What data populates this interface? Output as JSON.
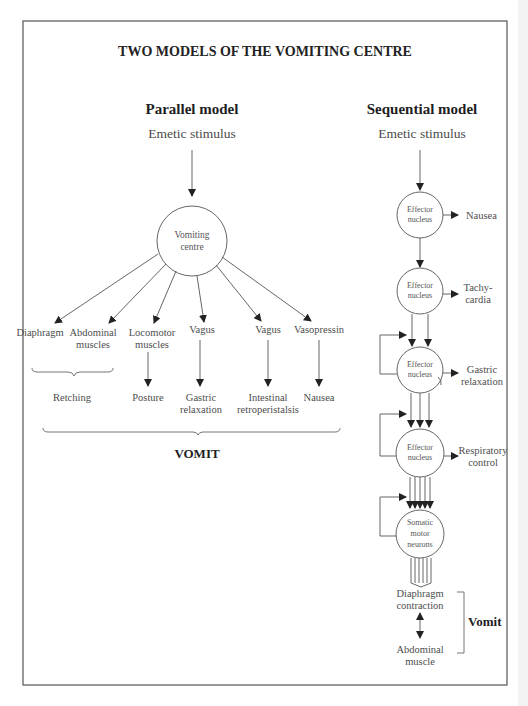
{
  "title": "TWO MODELS OF THE VOMITING CENTRE",
  "parallel": {
    "heading": "Parallel model",
    "stimulus": "Emetic stimulus",
    "centre": [
      "Vomiting",
      "centre"
    ],
    "outputs": [
      {
        "name": [
          "Diaphragm"
        ],
        "effect": null
      },
      {
        "name": [
          "Abdominal",
          "muscles"
        ],
        "effect": null
      },
      {
        "name": [
          "Locomotor",
          "muscles"
        ],
        "effect": [
          "Posture"
        ]
      },
      {
        "name": [
          "Vagus"
        ],
        "effect": [
          "Gastric",
          "relaxation"
        ]
      },
      {
        "name": [
          "Vagus"
        ],
        "effect": [
          "Intestinal",
          "retroperistalsis"
        ]
      },
      {
        "name": [
          "Vasopressin"
        ],
        "effect": [
          "Nausea"
        ]
      }
    ],
    "retching_label": "Retching",
    "vomit_label": "VOMIT"
  },
  "sequential": {
    "heading": "Sequential model",
    "stimulus": "Emetic stimulus",
    "nodes": [
      {
        "label": [
          "Effector",
          "nucleus"
        ],
        "output": [
          "Nausea"
        ]
      },
      {
        "label": [
          "Effector",
          "nucleus"
        ],
        "output": [
          "Tachy-",
          "cardia"
        ]
      },
      {
        "label": [
          "Effector",
          "nucleus"
        ],
        "output": [
          "Gastric",
          "relaxation"
        ]
      },
      {
        "label": [
          "Effector",
          "nucleus"
        ],
        "output": [
          "Respiratory",
          "control"
        ]
      },
      {
        "label": [
          "Somatic",
          "motor",
          "neurons"
        ],
        "output": null
      }
    ],
    "final_top": [
      "Diaphragm",
      "contraction"
    ],
    "final_bottom": [
      "Abdominal",
      "muscle"
    ],
    "vomit_label": "Vomit"
  }
}
